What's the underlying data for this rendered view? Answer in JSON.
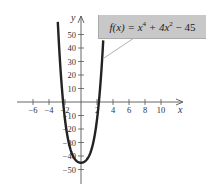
{
  "chart_data": {
    "type": "line",
    "title": "",
    "function_label": "f(x) = x^4 + 4x^2 - 45",
    "xlabel": "x",
    "ylabel": "y",
    "xlim": [
      -7,
      12
    ],
    "ylim": [
      -58,
      60
    ],
    "x_ticks": [
      -6,
      -4,
      -2,
      2,
      4,
      6,
      8,
      10
    ],
    "x_tick_labels": [
      "−6",
      "−4",
      "−2",
      "2",
      "4",
      "6",
      "8",
      "10"
    ],
    "y_ticks": [
      50,
      40,
      30,
      20,
      10,
      -10,
      -20,
      -30,
      -40,
      -50
    ],
    "y_tick_labels": [
      "50",
      "40",
      "30",
      "20",
      "10",
      "−10",
      "−20",
      "−30",
      "−40",
      "−50"
    ],
    "grid": false,
    "legend": "callout box top-right",
    "series": [
      {
        "name": "f(x) = x^4 + 4x^2 - 45",
        "x": [
          -2.9,
          -2.5,
          -2.0,
          -1.5,
          -1.0,
          -0.5,
          0,
          0.5,
          1.0,
          1.5,
          2.0,
          2.5,
          2.78
        ],
        "y": [
          59.4,
          19.1,
          -13,
          -30.9,
          -40,
          -43.9,
          -45,
          -43.9,
          -40,
          -30.9,
          -13,
          19.1,
          45.6
        ]
      }
    ],
    "color": "#222222"
  },
  "callout": {
    "fx": "f(x)",
    "eq": " = x",
    "exp1": "4",
    "mid": " + 4x",
    "exp2": "2",
    "tail": " − 45"
  }
}
